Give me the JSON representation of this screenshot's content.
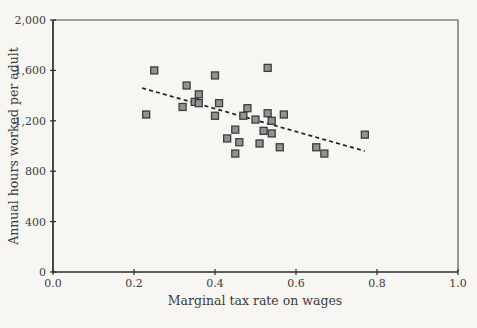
{
  "chart_data": {
    "type": "scatter",
    "title": "",
    "xlabel": "Marginal tax rate on wages",
    "ylabel": "Annual hours worked per adult",
    "xlim": [
      0.0,
      1.0
    ],
    "ylim": [
      0,
      2000
    ],
    "x_ticks": [
      0.0,
      0.2,
      0.4,
      0.6,
      0.8,
      1.0
    ],
    "x_tick_labels": [
      "0.0",
      "0.2",
      "0.4",
      "0.6",
      "0.8",
      "1.0"
    ],
    "y_ticks": [
      0,
      400,
      800,
      1200,
      1600,
      2000
    ],
    "y_tick_labels": [
      "0",
      "400",
      "800",
      "1,200",
      "1,600",
      "2,000"
    ],
    "grid": false,
    "legend": "none",
    "marker": "square",
    "points": [
      {
        "x": 0.23,
        "y": 1250
      },
      {
        "x": 0.25,
        "y": 1600
      },
      {
        "x": 0.32,
        "y": 1310
      },
      {
        "x": 0.33,
        "y": 1480
      },
      {
        "x": 0.35,
        "y": 1350
      },
      {
        "x": 0.36,
        "y": 1340
      },
      {
        "x": 0.36,
        "y": 1410
      },
      {
        "x": 0.4,
        "y": 1560
      },
      {
        "x": 0.4,
        "y": 1240
      },
      {
        "x": 0.41,
        "y": 1340
      },
      {
        "x": 0.43,
        "y": 1060
      },
      {
        "x": 0.45,
        "y": 1130
      },
      {
        "x": 0.45,
        "y": 940
      },
      {
        "x": 0.46,
        "y": 1030
      },
      {
        "x": 0.47,
        "y": 1240
      },
      {
        "x": 0.48,
        "y": 1300
      },
      {
        "x": 0.5,
        "y": 1210
      },
      {
        "x": 0.51,
        "y": 1020
      },
      {
        "x": 0.52,
        "y": 1120
      },
      {
        "x": 0.53,
        "y": 1620
      },
      {
        "x": 0.53,
        "y": 1260
      },
      {
        "x": 0.54,
        "y": 1200
      },
      {
        "x": 0.54,
        "y": 1100
      },
      {
        "x": 0.56,
        "y": 990
      },
      {
        "x": 0.57,
        "y": 1250
      },
      {
        "x": 0.65,
        "y": 990
      },
      {
        "x": 0.67,
        "y": 940
      },
      {
        "x": 0.77,
        "y": 1090
      }
    ],
    "trend_line": {
      "style": "dashed",
      "x1": 0.22,
      "y1": 1460,
      "x2": 0.77,
      "y2": 960
    },
    "colors": {
      "background": "#f8f6f2",
      "marker_fill": "#929292",
      "marker_border": "#3d3d3d",
      "axis": "#2e2d2b",
      "frame": "#4e4d4a",
      "trend": "#1f1f1f",
      "text": "#3c3b38"
    }
  }
}
